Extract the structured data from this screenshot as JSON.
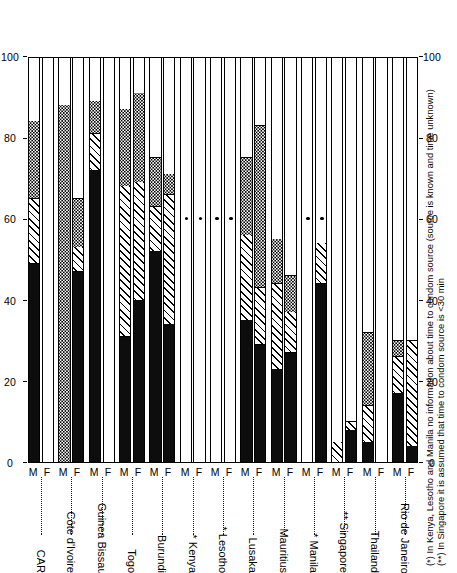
{
  "chart_data": {
    "type": "bar",
    "orientation": "vertical-stacked-rotated",
    "title": "",
    "xlabel": "",
    "ylabel": "",
    "ylim": [
      0,
      100
    ],
    "ticks": [
      0,
      20,
      40,
      60,
      80,
      100
    ],
    "grid": false,
    "legend_position": "none",
    "subgroups": [
      "M",
      "F"
    ],
    "series": [
      {
        "name": "<30 min",
        "pattern": "black"
      },
      {
        "name": "30 min - 1 h",
        "pattern": "hatch"
      },
      {
        "name": "source known, time unknown",
        "pattern": "dots"
      },
      {
        "name": "no source / remainder",
        "pattern": "white"
      }
    ],
    "categories": [
      "CAR",
      "Côte d'Ivoire",
      "Guinea Bissau",
      "Togo",
      "Burundi",
      "* Kenya",
      "* Lesotho",
      "Lusaka",
      "Mauritius",
      "* Manila",
      "** Singapore",
      "Thailand",
      "Rio de Janeiro"
    ],
    "bars": [
      {
        "category": "CAR",
        "sex": "M",
        "black": 49,
        "hatch": 16,
        "dots": 19,
        "white": 16,
        "star": false
      },
      {
        "category": "CAR",
        "sex": "F",
        "black": 0,
        "hatch": 0,
        "dots": 0,
        "white": 100,
        "star": false
      },
      {
        "category": "Côte d'Ivoire",
        "sex": "M",
        "black": 0,
        "hatch": 0,
        "dots": 88,
        "white": 12,
        "star": false
      },
      {
        "category": "Côte d'Ivoire",
        "sex": "F",
        "black": 47,
        "hatch": 6,
        "dots": 12,
        "white": 35,
        "star": false
      },
      {
        "category": "Guinea Bissau",
        "sex": "M",
        "black": 72,
        "hatch": 9,
        "dots": 8,
        "white": 11,
        "star": false
      },
      {
        "category": "Guinea Bissau",
        "sex": "F",
        "black": 0,
        "hatch": 0,
        "dots": 0,
        "white": 100,
        "star": false
      },
      {
        "category": "Togo",
        "sex": "M",
        "black": 31,
        "hatch": 37,
        "dots": 19,
        "white": 13,
        "star": false
      },
      {
        "category": "Togo",
        "sex": "F",
        "black": 40,
        "hatch": 29,
        "dots": 22,
        "white": 9,
        "star": false
      },
      {
        "category": "Burundi",
        "sex": "M",
        "black": 52,
        "hatch": 11,
        "dots": 12,
        "white": 25,
        "star": false
      },
      {
        "category": "Burundi",
        "sex": "F",
        "black": 34,
        "hatch": 32,
        "dots": 5,
        "white": 29,
        "star": false
      },
      {
        "category": "* Kenya",
        "sex": "M",
        "black": 0,
        "hatch": 0,
        "dots": 0,
        "white": 100,
        "star": true
      },
      {
        "category": "* Kenya",
        "sex": "F",
        "black": 0,
        "hatch": 0,
        "dots": 0,
        "white": 100,
        "star": true
      },
      {
        "category": "* Lesotho",
        "sex": "M",
        "black": 0,
        "hatch": 0,
        "dots": 0,
        "white": 100,
        "star": true
      },
      {
        "category": "* Lesotho",
        "sex": "F",
        "black": 0,
        "hatch": 0,
        "dots": 0,
        "white": 100,
        "star": true
      },
      {
        "category": "Lusaka",
        "sex": "M",
        "black": 35,
        "hatch": 21,
        "dots": 19,
        "white": 25,
        "star": false
      },
      {
        "category": "Lusaka",
        "sex": "F",
        "black": 29,
        "hatch": 14,
        "dots": 40,
        "white": 17,
        "star": false
      },
      {
        "category": "Mauritius",
        "sex": "M",
        "black": 23,
        "hatch": 21,
        "dots": 11,
        "white": 45,
        "star": false
      },
      {
        "category": "Mauritius",
        "sex": "F",
        "black": 27,
        "hatch": 10,
        "dots": 9,
        "white": 54,
        "star": false
      },
      {
        "category": "* Manila",
        "sex": "M",
        "black": 0,
        "hatch": 0,
        "dots": 0,
        "white": 100,
        "star": true
      },
      {
        "category": "* Manila",
        "sex": "F",
        "black": 44,
        "hatch": 10,
        "dots": 0,
        "white": 46,
        "star": true
      },
      {
        "category": "** Singapore",
        "sex": "M",
        "black": 0,
        "hatch": 5,
        "dots": 0,
        "white": 95,
        "star": false
      },
      {
        "category": "** Singapore",
        "sex": "F",
        "black": 8,
        "hatch": 2,
        "dots": 0,
        "white": 90,
        "star": false
      },
      {
        "category": "Thailand",
        "sex": "M",
        "black": 5,
        "hatch": 9,
        "dots": 18,
        "white": 68,
        "star": false
      },
      {
        "category": "Thailand",
        "sex": "F",
        "black": 0,
        "hatch": 0,
        "dots": 0,
        "white": 100,
        "star": false
      },
      {
        "category": "Rio de Janeiro",
        "sex": "M",
        "black": 17,
        "hatch": 9,
        "dots": 4,
        "white": 70,
        "star": false
      },
      {
        "category": "Rio de Janeiro",
        "sex": "F",
        "black": 4,
        "hatch": 26,
        "dots": 0,
        "white": 70,
        "star": false
      }
    ]
  },
  "axis": {
    "tick_labels": [
      "0",
      "20",
      "40",
      "60",
      "80",
      "100"
    ]
  },
  "footnotes": [
    "(*) In Kenya, Lesotho and Manila no information about time to condom source (source is known and time unknown)",
    "(**) In Singapore it is assumed that time to condom source is <30 min"
  ]
}
